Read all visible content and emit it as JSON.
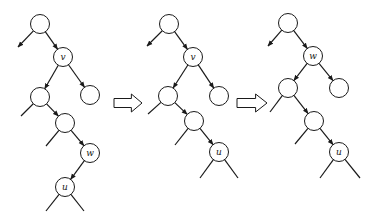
{
  "diagram": {
    "node_radius": 9.5,
    "colors": {
      "stroke": "#1a1a1a",
      "fill": "#ffffff",
      "background": "#ffffff"
    },
    "trees": [
      {
        "id": "tree-1",
        "nodes": [
          {
            "id": "t1-root",
            "x": 40,
            "y": 24,
            "label": ""
          },
          {
            "id": "t1-v",
            "x": 63,
            "y": 57,
            "label": "v"
          },
          {
            "id": "t1-vl",
            "x": 40,
            "y": 97,
            "label": ""
          },
          {
            "id": "t1-vr",
            "x": 90,
            "y": 95,
            "label": ""
          },
          {
            "id": "t1-a",
            "x": 65,
            "y": 123,
            "label": ""
          },
          {
            "id": "t1-w",
            "x": 90,
            "y": 153,
            "label": "w"
          },
          {
            "id": "t1-u",
            "x": 65,
            "y": 187,
            "label": "u"
          }
        ],
        "edges": [
          {
            "from": "t1-root",
            "to_point": [
              18,
              47
            ],
            "arrow": true
          },
          {
            "from": "t1-root",
            "to": "t1-v",
            "arrow": true
          },
          {
            "from": "t1-v",
            "to": "t1-vl",
            "arrow": true
          },
          {
            "from": "t1-v",
            "to": "t1-vr",
            "arrow": true
          },
          {
            "from": "t1-vl",
            "to_point": [
              21,
              116
            ],
            "arrow": false
          },
          {
            "from": "t1-vl",
            "to": "t1-a",
            "arrow": true
          },
          {
            "from": "t1-a",
            "to_point": [
              46,
              146
            ],
            "arrow": false
          },
          {
            "from": "t1-a",
            "to": "t1-w",
            "arrow": true
          },
          {
            "from": "t1-w",
            "to": "t1-u",
            "arrow": true
          },
          {
            "from": "t1-u",
            "to_point": [
              46,
              211
            ],
            "arrow": false
          },
          {
            "from": "t1-u",
            "to_point": [
              84,
              211
            ],
            "arrow": false
          }
        ]
      },
      {
        "id": "tree-2",
        "nodes": [
          {
            "id": "t2-root",
            "x": 169,
            "y": 24,
            "label": ""
          },
          {
            "id": "t2-v",
            "x": 193,
            "y": 57,
            "label": "v"
          },
          {
            "id": "t2-vl",
            "x": 168,
            "y": 96,
            "label": ""
          },
          {
            "id": "t2-vr",
            "x": 219,
            "y": 96,
            "label": ""
          },
          {
            "id": "t2-a",
            "x": 194,
            "y": 121,
            "label": ""
          },
          {
            "id": "t2-u",
            "x": 219,
            "y": 152,
            "label": "u"
          }
        ],
        "edges": [
          {
            "from": "t2-root",
            "to_point": [
              147,
              46
            ],
            "arrow": true
          },
          {
            "from": "t2-root",
            "to": "t2-v",
            "arrow": true
          },
          {
            "from": "t2-v",
            "to": "t2-vl",
            "arrow": true
          },
          {
            "from": "t2-v",
            "to": "t2-vr",
            "arrow": true
          },
          {
            "from": "t2-vl",
            "to_point": [
              148,
              114
            ],
            "arrow": false
          },
          {
            "from": "t2-vl",
            "to": "t2-a",
            "arrow": true
          },
          {
            "from": "t2-a",
            "to_point": [
              175,
              145
            ],
            "arrow": false
          },
          {
            "from": "t2-a",
            "to": "t2-u",
            "arrow": true
          },
          {
            "from": "t2-u",
            "to_point": [
              200,
              178
            ],
            "arrow": false
          },
          {
            "from": "t2-u",
            "to_point": [
              238,
              178
            ],
            "arrow": false
          }
        ]
      },
      {
        "id": "tree-3",
        "nodes": [
          {
            "id": "t3-root",
            "x": 288,
            "y": 23,
            "label": ""
          },
          {
            "id": "t3-w",
            "x": 313,
            "y": 56,
            "label": "w"
          },
          {
            "id": "t3-wl",
            "x": 288,
            "y": 88,
            "label": ""
          },
          {
            "id": "t3-wr",
            "x": 339,
            "y": 88,
            "label": ""
          },
          {
            "id": "t3-a",
            "x": 314,
            "y": 121,
            "label": ""
          },
          {
            "id": "t3-u",
            "x": 339,
            "y": 152,
            "label": "u"
          }
        ],
        "edges": [
          {
            "from": "t3-root",
            "to_point": [
              268,
              46
            ],
            "arrow": true
          },
          {
            "from": "t3-root",
            "to": "t3-w",
            "arrow": true
          },
          {
            "from": "t3-w",
            "to": "t3-wl",
            "arrow": true
          },
          {
            "from": "t3-w",
            "to": "t3-wr",
            "arrow": true
          },
          {
            "from": "t3-wl",
            "to_point": [
              270,
              112
            ],
            "arrow": false
          },
          {
            "from": "t3-wl",
            "to": "t3-a",
            "arrow": true
          },
          {
            "from": "t3-a",
            "to_point": [
              295,
              144
            ],
            "arrow": false
          },
          {
            "from": "t3-a",
            "to": "t3-u",
            "arrow": true
          },
          {
            "from": "t3-u",
            "to_point": [
              320,
              178
            ],
            "arrow": false
          },
          {
            "from": "t3-u",
            "to_point": [
              360,
              178
            ],
            "arrow": false
          }
        ]
      }
    ],
    "transition_arrows": [
      {
        "id": "arrow-1-to-2",
        "x": 114,
        "y": 94,
        "width": 28,
        "height": 18
      },
      {
        "id": "arrow-2-to-3",
        "x": 237,
        "y": 94,
        "width": 30,
        "height": 18
      }
    ]
  }
}
